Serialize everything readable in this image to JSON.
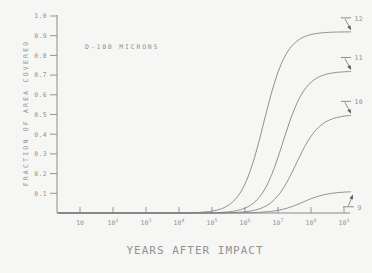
{
  "figure": {
    "background": "#f6f6f4",
    "line_color": "#828282",
    "axis_color": "#8a8a8a",
    "text_color": "#929292",
    "arrow_color": "#5a5a5a"
  },
  "chart_data": {
    "type": "line",
    "title": "",
    "xlabel": "YEARS AFTER IMPACT",
    "ylabel": "FRACTION OF AREA COVERED",
    "annotation": "D-100 MICRONS",
    "x_scale": "log10",
    "x_tick_base": "10",
    "x_tick_exponents": [
      1,
      2,
      3,
      4,
      5,
      6,
      7,
      8,
      9
    ],
    "xlim_exp": [
      0.3,
      9.25
    ],
    "ylim": [
      0,
      1.0
    ],
    "y_tick_values": [
      0.1,
      0.2,
      0.3,
      0.4,
      0.5,
      0.6,
      0.7,
      0.8,
      0.9,
      1.0
    ],
    "y_tick_labels": [
      "0.1",
      "0.2",
      "0.3",
      "0.4",
      "0.5",
      "0.6",
      "0.7",
      "0.8",
      "0.9",
      "1.0"
    ],
    "grid": false,
    "legend": null,
    "series": [
      {
        "label": "12",
        "plateau": 0.92,
        "midpoint_exp": 6.57,
        "steepness": 2.9,
        "label_side": "above",
        "sample_x_exp": [
          4,
          5,
          6,
          6.5,
          7,
          7.5,
          8,
          9
        ],
        "sample_y": [
          0.001,
          0.01,
          0.15,
          0.41,
          0.71,
          0.86,
          0.91,
          0.92
        ]
      },
      {
        "label": "11",
        "plateau": 0.72,
        "midpoint_exp": 7.15,
        "steepness": 2.9,
        "label_side": "above",
        "sample_x_exp": [
          5,
          6,
          6.5,
          7,
          7.5,
          8,
          8.5,
          9
        ],
        "sample_y": [
          0.002,
          0.025,
          0.095,
          0.28,
          0.53,
          0.66,
          0.71,
          0.72
        ]
      },
      {
        "label": "10",
        "plateau": 0.5,
        "midpoint_exp": 7.55,
        "steepness": 2.8,
        "label_side": "above",
        "sample_x_exp": [
          6,
          6.5,
          7,
          7.5,
          8,
          8.5,
          9
        ],
        "sample_y": [
          0.006,
          0.025,
          0.09,
          0.23,
          0.39,
          0.47,
          0.49
        ]
      },
      {
        "label": "9",
        "plateau": 0.11,
        "midpoint_exp": 7.75,
        "steepness": 2.6,
        "label_side": "below",
        "sample_x_exp": [
          6,
          7,
          7.5,
          8,
          8.5,
          9
        ],
        "sample_y": [
          0.002,
          0.013,
          0.032,
          0.073,
          0.096,
          0.107
        ]
      }
    ]
  }
}
